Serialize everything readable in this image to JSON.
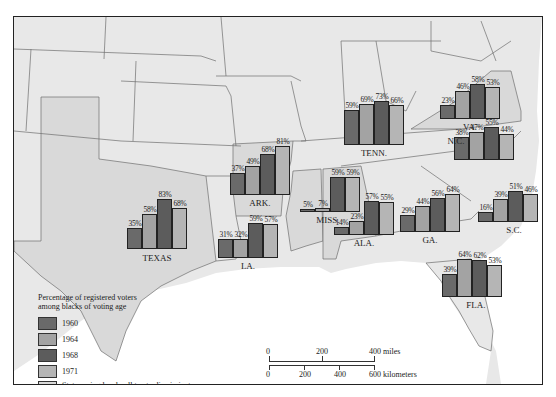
{
  "colors": {
    "c1960": "#6a6a6a",
    "c1964": "#a3a3a3",
    "c1968": "#5c5c5c",
    "c1971": "#b5b5b5",
    "poll_tax": "#d9d9d9",
    "land": "#e8e8e8",
    "water": "#ffffff",
    "border": "#6e6e6e"
  },
  "legend": {
    "title_line1": "Percentage of registered voters",
    "title_line2": "among blacks of voting age",
    "items": [
      {
        "label": "1960",
        "color": "#6a6a6a"
      },
      {
        "label": "1964",
        "color": "#a3a3a3"
      },
      {
        "label": "1968",
        "color": "#5c5c5c"
      },
      {
        "label": "1971",
        "color": "#b5b5b5"
      }
    ],
    "poll_tax_line1": "States using local poll tax to discriminate",
    "poll_tax_line2": "against black voters until 1965"
  },
  "scale": {
    "miles": [
      "0",
      "200",
      "400 miles"
    ],
    "km": [
      "0",
      "200",
      "400",
      "600 kilometers"
    ]
  },
  "chart_data": {
    "type": "bar",
    "title": "Percentage of registered voters among blacks of voting age",
    "categories": [
      "1960",
      "1964",
      "1968",
      "1971"
    ],
    "states": [
      {
        "name": "TEXAS",
        "values": [
          35,
          58,
          83,
          68
        ],
        "labels": [
          "35%",
          "58%",
          "83%",
          "68%"
        ]
      },
      {
        "name": "ARK.",
        "values": [
          37,
          49,
          68,
          81
        ],
        "labels": [
          "37%",
          "49%",
          "68%",
          "81%"
        ]
      },
      {
        "name": "LA.",
        "values": [
          31,
          32,
          59,
          57
        ],
        "labels": [
          "31%",
          "32%",
          "59%",
          "57%"
        ]
      },
      {
        "name": "MISS.",
        "values": [
          5,
          7,
          59,
          59
        ],
        "labels": [
          "5%",
          "7%",
          "59%",
          "59%"
        ]
      },
      {
        "name": "ALA.",
        "values": [
          14,
          23,
          57,
          55
        ],
        "labels": [
          "14%",
          "23%",
          "57%",
          "55%"
        ]
      },
      {
        "name": "TENN.",
        "values": [
          59,
          69,
          73,
          66
        ],
        "labels": [
          "59%",
          "69%",
          "73%",
          "66%"
        ]
      },
      {
        "name": "GA.",
        "values": [
          29,
          44,
          56,
          64
        ],
        "labels": [
          "29%",
          "44%",
          "56%",
          "64%"
        ]
      },
      {
        "name": "FLA.",
        "values": [
          39,
          64,
          62,
          53
        ],
        "labels": [
          "39%",
          "64%",
          "62%",
          "53%"
        ]
      },
      {
        "name": "S.C.",
        "values": [
          16,
          39,
          51,
          46
        ],
        "labels": [
          "16%",
          "39%",
          "51%",
          "46%"
        ]
      },
      {
        "name": "N.C.",
        "values": [
          38,
          47,
          55,
          44
        ],
        "labels": [
          "38%",
          "47%",
          "55%",
          "44%"
        ]
      },
      {
        "name": "VA.",
        "values": [
          23,
          46,
          58,
          53
        ],
        "labels": [
          "23%",
          "46%",
          "58%",
          "53%"
        ]
      }
    ],
    "poll_tax_states": [
      "TEXAS",
      "ARK.",
      "MISS.",
      "ALA.",
      "VA."
    ],
    "ylim": [
      0,
      100
    ],
    "legend_position": "bottom-left"
  }
}
